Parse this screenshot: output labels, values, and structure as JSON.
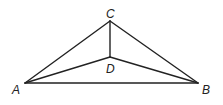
{
  "figure": {
    "type": "geometry-diagram",
    "stroke_color": "#222222",
    "points": {
      "A": {
        "label": "A",
        "x": 25,
        "y": 83,
        "label_x": 12,
        "label_y": 94
      },
      "B": {
        "label": "B",
        "x": 198,
        "y": 83,
        "label_x": 202,
        "label_y": 94
      },
      "C": {
        "label": "C",
        "x": 110,
        "y": 21,
        "label_x": 106,
        "label_y": 18
      },
      "D": {
        "label": "D",
        "x": 110,
        "y": 57,
        "label_x": 106,
        "label_y": 73
      }
    },
    "segments": [
      [
        "A",
        "B"
      ],
      [
        "A",
        "C"
      ],
      [
        "B",
        "C"
      ],
      [
        "C",
        "D"
      ],
      [
        "A",
        "D"
      ],
      [
        "B",
        "D"
      ]
    ]
  }
}
